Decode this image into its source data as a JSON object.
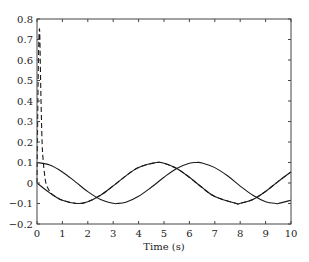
{
  "chart_data": {
    "type": "line",
    "title": "",
    "xlabel": "Time (s)",
    "ylabel": "",
    "xlim": [
      0,
      10
    ],
    "ylim": [
      -0.2,
      0.8
    ],
    "x_ticks": [
      0,
      1,
      2,
      3,
      4,
      5,
      6,
      7,
      8,
      9,
      10
    ],
    "x_tick_labels": [
      "0",
      "1",
      "2",
      "3",
      "4",
      "5",
      "6",
      "7",
      "8",
      "9",
      "10"
    ],
    "y_ticks": [
      -0.2,
      -0.1,
      0,
      0.1,
      0.2,
      0.3,
      0.4,
      0.5,
      0.6,
      0.7,
      0.8
    ],
    "y_tick_labels": [
      "−0.2",
      "−0.1",
      "0",
      "0.1",
      "0.2",
      "0.3",
      "0.4",
      "0.5",
      "0.6",
      "0.7",
      "0.8"
    ],
    "grid": false,
    "legend": null,
    "series": [
      {
        "name": "solid-cos",
        "style": "solid",
        "x": [
          0,
          0.5,
          1,
          1.5,
          2,
          2.5,
          3,
          3.14,
          3.5,
          4,
          4.5,
          5,
          5.5,
          6,
          6.28,
          6.5,
          7,
          7.5,
          8,
          8.5,
          9,
          9.42,
          9.5,
          10
        ],
        "y": [
          0.1,
          0.088,
          0.054,
          0.007,
          -0.042,
          -0.08,
          -0.099,
          -0.1,
          -0.094,
          -0.065,
          -0.021,
          0.028,
          0.071,
          0.096,
          0.1,
          0.098,
          0.075,
          0.035,
          -0.015,
          -0.06,
          -0.091,
          -0.1,
          -0.1,
          -0.084
        ]
      },
      {
        "name": "solid-sin",
        "style": "solid",
        "x": [
          0,
          0.5,
          1,
          1.57,
          2,
          2.5,
          3,
          3.5,
          4,
          4.71,
          5,
          5.5,
          6,
          6.5,
          7,
          7.85,
          8,
          8.5,
          9,
          9.5,
          10
        ],
        "y": [
          0,
          -0.048,
          -0.084,
          -0.1,
          -0.091,
          -0.06,
          -0.014,
          0.035,
          0.076,
          0.1,
          0.096,
          0.071,
          0.028,
          -0.022,
          -0.066,
          -0.1,
          -0.099,
          -0.08,
          -0.041,
          0.008,
          0.054
        ]
      },
      {
        "name": "dashed-response",
        "style": "dashed",
        "x": [
          0,
          0.05,
          0.1,
          0.15,
          0.2,
          0.25,
          0.3,
          0.35,
          0.45,
          0.6,
          0.8,
          1,
          1.57,
          2,
          2.5,
          3,
          3.5,
          4,
          4.71,
          5,
          5.5,
          6,
          6.5,
          7,
          7.85,
          8,
          8.5,
          9,
          9.5,
          10
        ],
        "y": [
          0,
          0.55,
          0.75,
          0.45,
          0.2,
          0.1,
          0.04,
          0.0,
          -0.03,
          -0.055,
          -0.072,
          -0.084,
          -0.1,
          -0.091,
          -0.06,
          -0.014,
          0.035,
          0.076,
          0.1,
          0.096,
          0.071,
          0.028,
          -0.022,
          -0.066,
          -0.1,
          -0.099,
          -0.08,
          -0.041,
          0.008,
          0.054
        ]
      }
    ]
  },
  "plot_area": {
    "left": 37,
    "top": 19,
    "right": 291,
    "bottom": 224
  },
  "colors": {
    "line": "#1a1a1a",
    "axis": "#444444",
    "background": "#ffffff"
  }
}
